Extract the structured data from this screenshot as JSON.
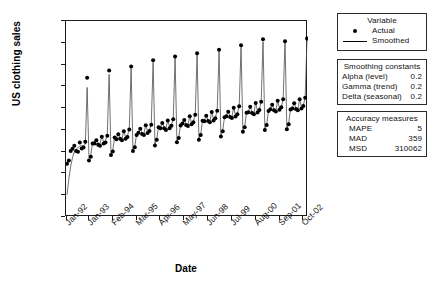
{
  "chart_data": {
    "type": "line",
    "title": "",
    "xlabel": "Date",
    "ylabel": "US clothing sales",
    "ylim": [
      0,
      18000
    ],
    "ytick_labels": [
      "18,000",
      "16,000",
      "14,000",
      "12,000",
      "10,000",
      "8000",
      "6000",
      "4000",
      "2000",
      "0"
    ],
    "ytick_values": [
      18000,
      16000,
      14000,
      12000,
      10000,
      8000,
      6000,
      4000,
      2000,
      0
    ],
    "xtick_labels": [
      "Jan-92",
      "Jan-93",
      "Feb-94",
      "Mar-95",
      "Apr-96",
      "May-97",
      "Jun-98",
      "Jul-99",
      "Aug-00",
      "Sep-01",
      "Oct-02"
    ],
    "xtick_index": [
      0,
      12,
      25,
      38,
      51,
      64,
      77,
      90,
      103,
      116,
      129
    ],
    "grid": false,
    "legend_position": "right",
    "x_start": "Jan-92",
    "x_end": "Dec-02",
    "n_points": 132,
    "series": [
      {
        "name": "Actual",
        "marker": "filled-circle",
        "values": [
          4889,
          5197,
          6061,
          6258,
          6545,
          6060,
          5996,
          6846,
          6291,
          6374,
          6905,
          12784,
          5180,
          5528,
          6756,
          6744,
          7056,
          6636,
          6552,
          7364,
          6743,
          6848,
          7470,
          13453,
          5705,
          6021,
          7309,
          7130,
          7608,
          7191,
          7050,
          7867,
          7192,
          7344,
          8031,
          13823,
          6069,
          6412,
          7524,
          7743,
          8102,
          7629,
          7529,
          8428,
          7725,
          7894,
          8469,
          14385,
          6574,
          7084,
          8245,
          8143,
          8624,
          8146,
          7997,
          8872,
          8156,
          8379,
          8977,
          14738,
          6866,
          7246,
          8401,
          8580,
          8904,
          8445,
          8356,
          9255,
          8514,
          8708,
          9401,
          15049,
          7103,
          7536,
          8830,
          8798,
          9288,
          8810,
          8702,
          9646,
          8870,
          9071,
          9759,
          15362,
          7390,
          7879,
          9150,
          9255,
          9663,
          9179,
          9088,
          10039,
          9237,
          9445,
          10162,
          15781,
          7824,
          8234,
          9574,
          9617,
          10115,
          9556,
          9438,
          10466,
          9604,
          9818,
          10573,
          16317,
          7988,
          8452,
          9734,
          9886,
          10310,
          9798,
          9693,
          10672,
          9856,
          10070,
          10810,
          16144,
          8056,
          8514,
          9880,
          9974,
          10442,
          9914,
          9810,
          10820,
          9974,
          10196,
          10958,
          16402
        ]
      },
      {
        "name": "Smoothed",
        "marker": "none",
        "values": [
          2050,
          3480,
          4650,
          5460,
          6000,
          6240,
          6350,
          6530,
          6560,
          6520,
          6700,
          11900,
          5400,
          5700,
          6900,
          6880,
          7150,
          6780,
          6700,
          7480,
          6880,
          6980,
          7600,
          13100,
          5800,
          6120,
          7400,
          7230,
          7700,
          7290,
          7150,
          7960,
          7290,
          7440,
          8120,
          13650,
          6160,
          6500,
          7610,
          7830,
          8190,
          7710,
          7610,
          8510,
          7810,
          7980,
          8550,
          14200,
          6650,
          7160,
          8320,
          8220,
          8700,
          8220,
          8070,
          8940,
          8230,
          8450,
          9050,
          14600,
          6940,
          7320,
          8470,
          8650,
          8970,
          8510,
          8420,
          9320,
          8580,
          8770,
          9470,
          14900,
          7170,
          7600,
          8890,
          8860,
          9350,
          8870,
          8760,
          9710,
          8930,
          9130,
          9820,
          15200,
          7450,
          7940,
          9210,
          9310,
          9720,
          9240,
          9150,
          10100,
          9300,
          9500,
          10220,
          15600,
          7880,
          8290,
          9630,
          9670,
          10170,
          9610,
          9490,
          10520,
          9660,
          9870,
          10630,
          16100,
          8040,
          8500,
          9790,
          9940,
          10360,
          9850,
          9740,
          10720,
          9910,
          10120,
          10860,
          16200,
          8110,
          8570,
          9930,
          10020,
          10490,
          9960,
          9860,
          10870,
          10020,
          10240,
          11000,
          16350
        ]
      }
    ]
  },
  "legend": {
    "title": "Variable",
    "items": [
      {
        "key": "filled-circle",
        "label": "Actual"
      },
      {
        "key": "line",
        "label": "Smoothed"
      }
    ]
  },
  "smoothing_constants": {
    "title": "Smoothing constants",
    "rows": [
      {
        "key": "Alpha (level)",
        "value": "0.2"
      },
      {
        "key": "Gamma (trend)",
        "value": "0.2"
      },
      {
        "key": "Delta (seasonal)",
        "value": "0.2"
      }
    ]
  },
  "accuracy_measures": {
    "title": "Accuracy measures",
    "rows": [
      {
        "key": "MAPE",
        "value": "5"
      },
      {
        "key": "MAD",
        "value": "359"
      },
      {
        "key": "MSD",
        "value": "310062"
      }
    ]
  },
  "colors": {
    "axis": "#1c1c1c",
    "marker": "#000000",
    "line": "#4d4d4d",
    "background": "#ffffff",
    "box_border": "#2a2a2a"
  }
}
